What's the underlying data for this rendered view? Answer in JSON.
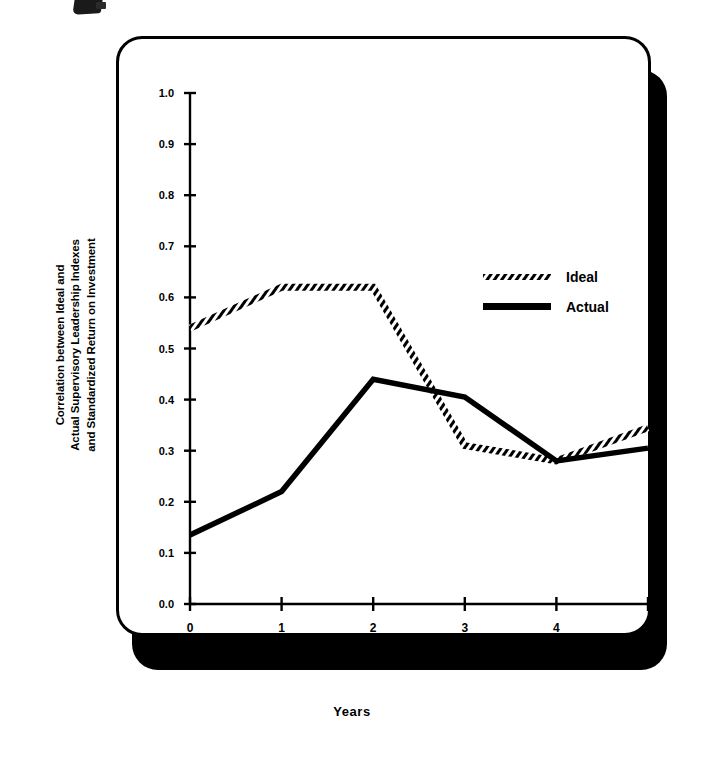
{
  "figure": {
    "y_axis_title_lines": [
      "Correlation between Ideal and",
      "Actual Supervisory Leadership Indexes",
      "and Standardized Return on Investment"
    ],
    "x_axis_title": "Years"
  },
  "chart_data": {
    "type": "line",
    "title": "",
    "xlabel": "Years",
    "ylabel": "Correlation between Ideal and Actual Supervisory Leadership Indexes and Standardized Return on Investment",
    "x": [
      0,
      1,
      2,
      3,
      4,
      5
    ],
    "xticklabels": [
      "0",
      "1",
      "2",
      "3",
      "4",
      "5"
    ],
    "xlim": [
      0,
      5
    ],
    "ylim": [
      0.0,
      1.0
    ],
    "yticks": [
      0.0,
      0.1,
      0.2,
      0.3,
      0.4,
      0.5,
      0.6,
      0.7,
      0.8,
      0.9,
      1.0
    ],
    "yticklabels": [
      "0.0",
      "0.1",
      "0.2",
      "0.3",
      "0.4",
      "0.5",
      "0.6",
      "0.7",
      "0.8",
      "0.9",
      "1.0"
    ],
    "grid": false,
    "legend_position": "upper right inside",
    "series": [
      {
        "name": "Ideal",
        "style": "hatched",
        "color": "#000000",
        "values": [
          0.54,
          0.62,
          0.62,
          0.31,
          0.28,
          0.345
        ]
      },
      {
        "name": "Actual",
        "style": "solid",
        "color": "#000000",
        "values": [
          0.135,
          0.22,
          0.44,
          0.405,
          0.28,
          0.305
        ]
      }
    ]
  },
  "legend": {
    "items": [
      {
        "label": "Ideal",
        "style": "hatched"
      },
      {
        "label": "Actual",
        "style": "solid"
      }
    ]
  }
}
